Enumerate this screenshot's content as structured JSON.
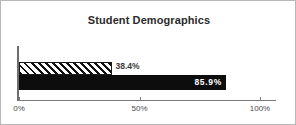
{
  "chart_data": {
    "type": "bar",
    "orientation": "horizontal",
    "title": "Student Demographics",
    "xlabel": "",
    "ylabel": "",
    "xlim": [
      0,
      100
    ],
    "grid": false,
    "legend": "none",
    "categories": [
      "Series 1",
      "Series 2"
    ],
    "series": [
      {
        "name": "Series 1",
        "value": 38.4,
        "label": "38.4%",
        "fill": "diagonal-hatch",
        "label_position": "outside",
        "label_color": "#3a3a3a"
      },
      {
        "name": "Series 2",
        "value": 85.9,
        "label": "85.9%",
        "fill": "solid-black",
        "label_position": "inside",
        "label_color": "#ffffff"
      }
    ],
    "axis_ticks": [
      {
        "value": 0,
        "label": "0%"
      },
      {
        "value": 50,
        "label": "50%"
      },
      {
        "value": 100,
        "label": "100%"
      }
    ],
    "colors": {
      "bar_solid": "#0d0d0d",
      "bar_hatch_line": "#111111",
      "bar_hatch_background": "#ffffff",
      "axis": "#7a7a7a",
      "title_text": "#2b2b2b",
      "tick_text": "#4a4a4a",
      "frame_border": "#b8b8b8",
      "background": "#ffffff"
    }
  }
}
